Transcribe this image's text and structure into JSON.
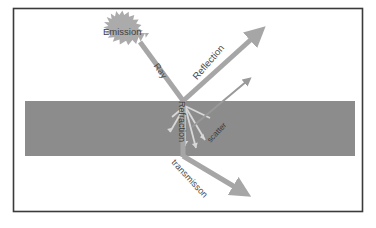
{
  "figure": {
    "title": "",
    "background_color": "#ffffff",
    "frame": {
      "border_color": "#3a3a3a",
      "x": 13,
      "y": 8,
      "width": 350,
      "height": 204
    },
    "medium_slab": {
      "name": "medium-slab",
      "fill_color": "#8c8c8c",
      "x": 25,
      "y": 101,
      "width": 330,
      "height": 55
    }
  },
  "labels": {
    "emission": "Emission",
    "ray": "Ray",
    "reflection": "Reflection",
    "refraction": "Refraction",
    "scatter": "scatter",
    "transmission": "transmisson"
  },
  "arrows": {
    "ray": {
      "label": "Ray",
      "color": "#a6a6a6",
      "from": [
        140,
        42
      ],
      "to": [
        183,
        101
      ],
      "has_head": false,
      "thickness": 5
    },
    "reflection": {
      "label": "Reflection",
      "color": "#a6a6a6",
      "from": [
        183,
        101
      ],
      "to": [
        260,
        31
      ],
      "has_head": true,
      "thickness": 5
    },
    "refraction": {
      "label": "Refraction",
      "color": "#a6a6a6",
      "from": [
        183,
        101
      ],
      "to": [
        183,
        156
      ],
      "has_head": false,
      "thickness": 5
    },
    "transmission": {
      "label": "transmisson",
      "color": "#a6a6a6",
      "from": [
        183,
        156
      ],
      "to": [
        245,
        194
      ],
      "has_head": true,
      "thickness": 5
    },
    "scatter": {
      "label": "scatter",
      "color": "#999999",
      "from": [
        192,
        127
      ],
      "to": [
        251,
        77
      ],
      "has_head": true,
      "thickness": 2
    }
  },
  "scatter_rays": {
    "color": "#d8d8d8",
    "origin": [
      185,
      106
    ],
    "directions": [
      {
        "to": [
          170,
          132
        ]
      },
      {
        "to": [
          185,
          146
        ]
      },
      {
        "to": [
          205,
          140
        ]
      },
      {
        "to": [
          172,
          117
        ]
      },
      {
        "to": [
          210,
          118
        ]
      },
      {
        "to": [
          196,
          148
        ]
      }
    ]
  },
  "emission_source": {
    "name": "emission-burst",
    "shape": "starburst",
    "color": "#ababab",
    "center": [
      130,
      33
    ],
    "radius_outer": 19,
    "radius_inner": 16,
    "points": 22
  },
  "colors": {
    "slab": "#8c8c8c",
    "arrow": "#a6a6a6",
    "burst": "#ababab",
    "frame": "#3a3a3a",
    "text": "#4a4a4a",
    "scatter_ray": "#d8d8d8"
  }
}
